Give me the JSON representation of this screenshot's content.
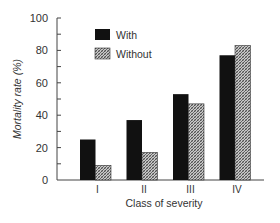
{
  "chart_data": {
    "type": "bar",
    "title": "",
    "xlabel": "Class of severity",
    "ylabel": "Mortality rate (%)",
    "ylim": [
      0,
      100
    ],
    "yticks": [
      0,
      20,
      40,
      60,
      80,
      100
    ],
    "yminor_step": 10,
    "grid": false,
    "legend_position": "top-left",
    "categories": [
      "I",
      "II",
      "III",
      "IV"
    ],
    "series": [
      {
        "name": "With",
        "fill": "solid",
        "color": "#111111",
        "values": [
          25,
          37,
          53,
          77
        ]
      },
      {
        "name": "Without",
        "fill": "hatched",
        "color": "#8a8a8a",
        "values": [
          9,
          17,
          47,
          83
        ]
      }
    ]
  }
}
